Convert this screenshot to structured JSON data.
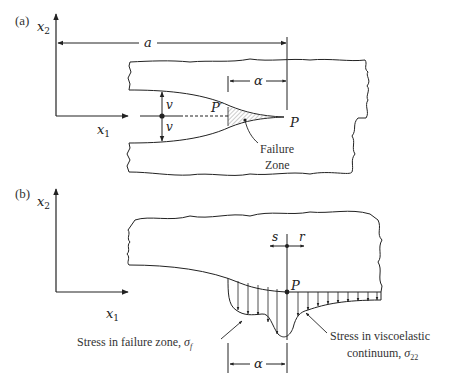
{
  "panel_a": {
    "tag": "(a)",
    "axis_x2": "x",
    "axis_x2_sub": "2",
    "axis_x1": "x",
    "axis_x1_sub": "1",
    "dim_a": "a",
    "dim_alpha": "α",
    "opening_top": "v",
    "opening_bottom": "v",
    "point_p_prime": "P′",
    "point_p": "P",
    "failure_zone_line1": "Failure",
    "failure_zone_line2": "Zone"
  },
  "panel_b": {
    "tag": "(b)",
    "axis_x2": "x",
    "axis_x2_sub": "2",
    "axis_x1": "x",
    "axis_x1_sub": "1",
    "coord_s": "s",
    "coord_r": "r",
    "point_p": "P",
    "dim_alpha": "α",
    "label_failure_stress": "Stress in failure zone, ",
    "label_failure_symbol": "σ",
    "label_failure_sub": "f",
    "label_visco_line1": "Stress in viscoelastic",
    "label_visco_line2": "continuum, ",
    "label_visco_symbol": "σ",
    "label_visco_sub": "22"
  },
  "colors": {
    "line": "#222222",
    "text": "#333333",
    "hatch": "#9a9a9a"
  }
}
